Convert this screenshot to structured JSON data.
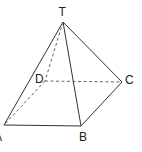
{
  "diagram": {
    "type": "square-pyramid",
    "stroke_color": "#333333",
    "vertices": {
      "T": {
        "label": "T",
        "x": 63,
        "y": 22
      },
      "D": {
        "label": "D",
        "x": 45,
        "y": 81
      },
      "C": {
        "label": "C",
        "x": 122,
        "y": 82
      },
      "A": {
        "label": "A",
        "x": 4,
        "y": 125
      },
      "B": {
        "label": "B",
        "x": 81,
        "y": 126
      }
    },
    "edges_solid": [
      [
        "T",
        "A"
      ],
      [
        "T",
        "B"
      ],
      [
        "T",
        "C"
      ],
      [
        "A",
        "B"
      ],
      [
        "B",
        "C"
      ]
    ],
    "edges_dashed": [
      [
        "T",
        "D"
      ],
      [
        "D",
        "A"
      ],
      [
        "D",
        "C"
      ]
    ]
  }
}
